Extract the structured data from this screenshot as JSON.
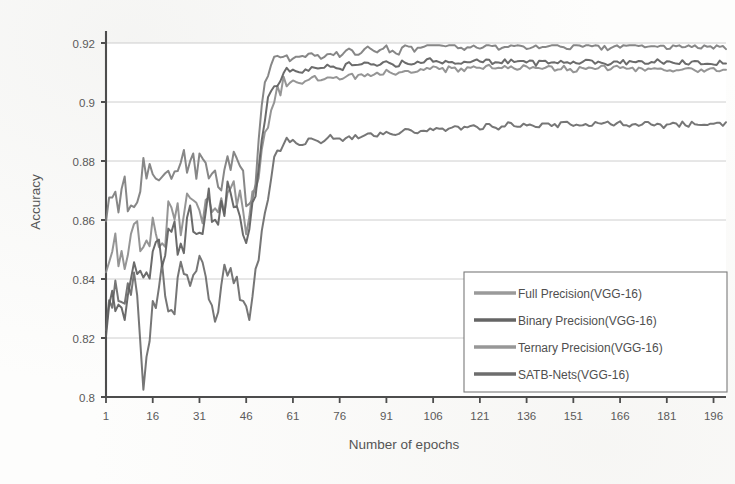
{
  "chart_data": {
    "type": "line",
    "title": "",
    "xlabel": "Number of epochs",
    "ylabel": "Accuracy",
    "xlim": [
      1,
      200
    ],
    "ylim": [
      0.8,
      0.92
    ],
    "grid": true,
    "legend_position": "inside-bottom-right",
    "xticks": [
      1,
      16,
      31,
      46,
      61,
      76,
      91,
      106,
      121,
      136,
      151,
      166,
      181,
      196
    ],
    "yticks": [
      0.8,
      0.82,
      0.84,
      0.86,
      0.88,
      0.9,
      0.92
    ],
    "ytick_labels": [
      "0.8",
      "0.82",
      "0.84",
      "0.86",
      "0.88",
      "0.9",
      "0.92"
    ],
    "x": [
      1,
      4,
      7,
      10,
      13,
      16,
      19,
      22,
      25,
      28,
      31,
      34,
      37,
      40,
      43,
      46,
      49,
      52,
      55,
      58,
      61,
      64,
      67,
      70,
      73,
      76,
      79,
      82,
      85,
      88,
      91,
      94,
      97,
      100,
      103,
      106,
      109,
      112,
      115,
      118,
      121,
      124,
      127,
      130,
      133,
      136,
      139,
      142,
      145,
      148,
      151,
      154,
      157,
      160,
      163,
      166,
      169,
      172,
      175,
      178,
      181,
      184,
      187,
      190,
      193,
      196,
      199
    ],
    "series": [
      {
        "name": "Full Precision(VGG-16)",
        "color": "#7d7d7d",
        "final_value": 0.9185,
        "values": [
          0.8615,
          0.8662,
          0.8703,
          0.8648,
          0.8745,
          0.8699,
          0.8768,
          0.8724,
          0.8805,
          0.8752,
          0.8828,
          0.8771,
          0.8702,
          0.8784,
          0.8846,
          0.8689,
          0.8757,
          0.9093,
          0.9135,
          0.9151,
          0.9142,
          0.9158,
          0.9163,
          0.9148,
          0.9172,
          0.9159,
          0.9181,
          0.9165,
          0.9188,
          0.9171,
          0.9183,
          0.9162,
          0.9191,
          0.9177,
          0.9196,
          0.9203,
          0.9188,
          0.9197,
          0.9182,
          0.9191,
          0.9186,
          0.9194,
          0.9181,
          0.9189,
          0.9196,
          0.9184,
          0.9192,
          0.9187,
          0.9195,
          0.9183,
          0.919,
          0.9186,
          0.9193,
          0.9188,
          0.9182,
          0.9191,
          0.9187,
          0.9194,
          0.9186,
          0.919,
          0.9184,
          0.9192,
          0.9188,
          0.9186,
          0.9191,
          0.9187,
          0.9186
        ]
      },
      {
        "name": "Binary Precision(VGG-16)",
        "color": "#6a6a6a",
        "final_value": 0.8922,
        "values": [
          0.8228,
          0.8341,
          0.8286,
          0.8402,
          0.8069,
          0.8312,
          0.8388,
          0.8256,
          0.8421,
          0.8332,
          0.8459,
          0.8361,
          0.8289,
          0.8447,
          0.8372,
          0.8238,
          0.8402,
          0.8612,
          0.8812,
          0.8851,
          0.8863,
          0.8858,
          0.8874,
          0.8866,
          0.8881,
          0.8872,
          0.8889,
          0.8878,
          0.8893,
          0.8884,
          0.8897,
          0.8888,
          0.8901,
          0.8893,
          0.8905,
          0.8912,
          0.8903,
          0.8916,
          0.8908,
          0.8919,
          0.8911,
          0.8921,
          0.8913,
          0.8923,
          0.8915,
          0.8924,
          0.8917,
          0.8926,
          0.8918,
          0.8927,
          0.8919,
          0.8928,
          0.8921,
          0.8929,
          0.8922,
          0.893,
          0.892,
          0.8928,
          0.8922,
          0.8926,
          0.8919,
          0.8927,
          0.8923,
          0.8925,
          0.8921,
          0.8924,
          0.8922
        ]
      },
      {
        "name": "Ternary Precision(VGG-16)",
        "color": "#8c8c8c",
        "final_value": 0.9112,
        "values": [
          0.8418,
          0.8506,
          0.8452,
          0.8571,
          0.8498,
          0.8612,
          0.8539,
          0.8648,
          0.8571,
          0.8683,
          0.8601,
          0.8702,
          0.8628,
          0.8718,
          0.8655,
          0.8602,
          0.8689,
          0.8891,
          0.9012,
          0.9058,
          0.9072,
          0.9068,
          0.9081,
          0.9074,
          0.9089,
          0.9081,
          0.9095,
          0.9087,
          0.9101,
          0.9092,
          0.9104,
          0.9096,
          0.9108,
          0.9099,
          0.9111,
          0.9116,
          0.9107,
          0.9118,
          0.9109,
          0.9119,
          0.9111,
          0.912,
          0.9112,
          0.9121,
          0.9113,
          0.9119,
          0.9111,
          0.9118,
          0.911,
          0.9117,
          0.9109,
          0.9116,
          0.911,
          0.9115,
          0.9108,
          0.9116,
          0.911,
          0.9114,
          0.9108,
          0.9113,
          0.9107,
          0.9114,
          0.911,
          0.9112,
          0.9108,
          0.9113,
          0.9112
        ]
      },
      {
        "name": "SATB-Nets(VGG-16)",
        "color": "#5e5e5e",
        "final_value": 0.9134,
        "values": [
          0.8192,
          0.8361,
          0.8288,
          0.8452,
          0.8371,
          0.8512,
          0.8428,
          0.8571,
          0.8489,
          0.8621,
          0.8538,
          0.8661,
          0.8572,
          0.8698,
          0.8612,
          0.8548,
          0.8702,
          0.8952,
          0.9068,
          0.9098,
          0.9108,
          0.9102,
          0.9116,
          0.9108,
          0.9122,
          0.9114,
          0.9128,
          0.9119,
          0.9131,
          0.9122,
          0.9134,
          0.9126,
          0.9137,
          0.9128,
          0.9139,
          0.9142,
          0.9133,
          0.9141,
          0.9132,
          0.914,
          0.9133,
          0.9141,
          0.9134,
          0.914,
          0.9133,
          0.9139,
          0.9132,
          0.9138,
          0.9131,
          0.9137,
          0.9132,
          0.9138,
          0.9133,
          0.9136,
          0.913,
          0.9137,
          0.9132,
          0.9136,
          0.9131,
          0.9135,
          0.913,
          0.9136,
          0.9133,
          0.9135,
          0.9131,
          0.9134,
          0.9134
        ]
      }
    ]
  },
  "legend": {
    "items": [
      {
        "label": "Full  Precision(VGG-16)",
        "color": "#9a9a9a"
      },
      {
        "label": "Binary Precision(VGG-16)",
        "color": "#656565"
      },
      {
        "label": "Ternary Precision(VGG-16)",
        "color": "#979797"
      },
      {
        "label": "SATB-Nets(VGG-16)",
        "color": "#6d6d6d"
      }
    ]
  }
}
